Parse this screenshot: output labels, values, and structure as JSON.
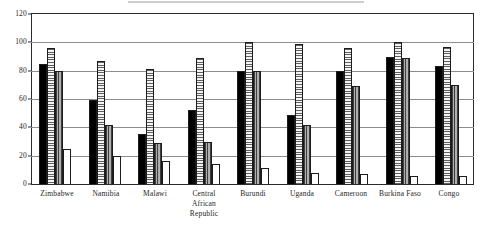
{
  "figure": {
    "background_color": "#ffffff",
    "frame_color": "#2b2b2b",
    "gridline_color": "#8d8d8d"
  },
  "chart_data": {
    "type": "bar",
    "title": "",
    "subtitle": "",
    "xlabel": "",
    "ylabel": "",
    "ylim": [
      0,
      120
    ],
    "yticks": [
      0,
      20,
      40,
      60,
      80,
      100,
      120
    ],
    "ytick_labels": [
      "0",
      "20",
      "40",
      "60",
      "80",
      "100",
      "120"
    ],
    "grid": true,
    "grid_axis": "y",
    "legend": false,
    "legend_position": "none",
    "orientation": "vertical",
    "grouping": "clustered",
    "categories": [
      "Zimbabwe",
      "Namibia",
      "Malawi",
      "Central African Republic",
      "Burundi",
      "Uganda",
      "Cameroon",
      "Burkina Faso",
      "Congo"
    ],
    "category_label_lines": [
      [
        "Zimbabwe"
      ],
      [
        "Namibia"
      ],
      [
        "Malawi"
      ],
      [
        "Central",
        "African",
        "Republic"
      ],
      [
        "Burundi"
      ],
      [
        "Uganda"
      ],
      [
        "Cameroon"
      ],
      [
        "Burkina Faso"
      ],
      [
        "Congo"
      ]
    ],
    "series": [
      {
        "name": "series-1",
        "fill": "solid-black",
        "color": "#000000",
        "values": [
          85,
          59,
          35,
          52,
          80,
          49,
          80,
          90,
          83
        ]
      },
      {
        "name": "series-2",
        "fill": "horizontal-hatch",
        "color": "#f1f1f1",
        "values": [
          96,
          87,
          81,
          89,
          100,
          99,
          96,
          100,
          97
        ]
      },
      {
        "name": "series-3",
        "fill": "vertical-hatch",
        "color": "#9a9a9a",
        "values": [
          80,
          42,
          29,
          30,
          80,
          42,
          69,
          89,
          70
        ]
      },
      {
        "name": "series-4",
        "fill": "white",
        "color": "#ffffff",
        "values": [
          25,
          20,
          16,
          14,
          11,
          8,
          7,
          6,
          6
        ]
      }
    ]
  }
}
